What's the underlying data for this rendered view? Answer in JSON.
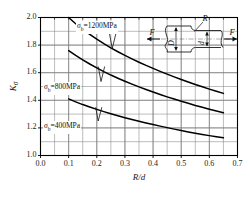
{
  "chart_data": {
    "type": "line",
    "title": "",
    "xlabel": "R/d",
    "ylabel": "Kσ",
    "xlim": [
      0.0,
      0.7
    ],
    "ylim": [
      1.0,
      2.0
    ],
    "xticks": [
      "0.0",
      "0.1",
      "0.2",
      "0.3",
      "0.4",
      "0.5",
      "0.6",
      "0.7"
    ],
    "xtick_values": [
      0.0,
      0.1,
      0.2,
      0.3,
      0.4,
      0.5,
      0.6,
      0.7
    ],
    "yticks": [
      "1.0",
      "1.2",
      "1.4",
      "1.6",
      "1.8",
      "2.0"
    ],
    "ytick_values": [
      1.0,
      1.2,
      1.4,
      1.6,
      1.8,
      2.0
    ],
    "grid": true,
    "grid_minor_x_step": 0.05,
    "grid_minor_y_step": 0.1,
    "legend_position": "inline-on-curve",
    "series": [
      {
        "name": "σb=1200MPa",
        "label": "1200MPa",
        "x": [
          0.1,
          0.125,
          0.15,
          0.175,
          0.2,
          0.225,
          0.25,
          0.275,
          0.3,
          0.325,
          0.35,
          0.375,
          0.4,
          0.425,
          0.45,
          0.475,
          0.5,
          0.525,
          0.55,
          0.575,
          0.6,
          0.625,
          0.65
        ],
        "values": [
          2.0,
          1.955,
          1.915,
          1.878,
          1.843,
          1.81,
          1.78,
          1.752,
          1.725,
          1.7,
          1.676,
          1.653,
          1.631,
          1.61,
          1.59,
          1.57,
          1.551,
          1.533,
          1.515,
          1.498,
          1.481,
          1.465,
          1.45
        ]
      },
      {
        "name": "σb=800MPa",
        "label": "800MPa",
        "x": [
          0.1,
          0.125,
          0.15,
          0.175,
          0.2,
          0.225,
          0.25,
          0.275,
          0.3,
          0.325,
          0.35,
          0.375,
          0.4,
          0.425,
          0.45,
          0.475,
          0.5,
          0.525,
          0.55,
          0.575,
          0.6,
          0.625,
          0.65
        ],
        "values": [
          1.76,
          1.725,
          1.693,
          1.663,
          1.635,
          1.608,
          1.583,
          1.56,
          1.538,
          1.517,
          1.497,
          1.478,
          1.46,
          1.442,
          1.425,
          1.409,
          1.393,
          1.378,
          1.363,
          1.349,
          1.335,
          1.322,
          1.31
        ]
      },
      {
        "name": "σb=400MPa",
        "label": "400MPa",
        "x": [
          0.1,
          0.125,
          0.15,
          0.175,
          0.2,
          0.225,
          0.25,
          0.275,
          0.3,
          0.325,
          0.35,
          0.375,
          0.4,
          0.425,
          0.45,
          0.475,
          0.5,
          0.525,
          0.55,
          0.575,
          0.6,
          0.625,
          0.65
        ],
        "values": [
          1.41,
          1.389,
          1.369,
          1.351,
          1.334,
          1.318,
          1.303,
          1.288,
          1.274,
          1.261,
          1.248,
          1.236,
          1.224,
          1.213,
          1.202,
          1.191,
          1.181,
          1.171,
          1.162,
          1.153,
          1.144,
          1.136,
          1.128
        ]
      }
    ],
    "annotations": [
      {
        "name": "label-1200",
        "text_sigma": "σ",
        "text_sub": "b",
        "text_rest": "=1200MPa"
      },
      {
        "name": "label-800",
        "text_sigma": "σ",
        "text_sub": "b",
        "text_rest": "=800MPa"
      },
      {
        "name": "label-400",
        "text_sigma": "σ",
        "text_sub": "b",
        "text_rest": "=400MPa"
      }
    ]
  },
  "axis": {
    "y_title_k": "K",
    "y_title_sub": "σ",
    "x_title": "R/d"
  },
  "inset": {
    "name": "stepped-shaft-tension-diagram",
    "force_left": "F",
    "force_right": "F",
    "radius_label": "R",
    "large_diameter_label": "D",
    "small_diameter_label": "d"
  },
  "colors": {
    "curve": "#000000",
    "grid": "#7a7a7a",
    "axis": "#000000",
    "text": "#1a1a1a",
    "background": "#ffffff"
  }
}
